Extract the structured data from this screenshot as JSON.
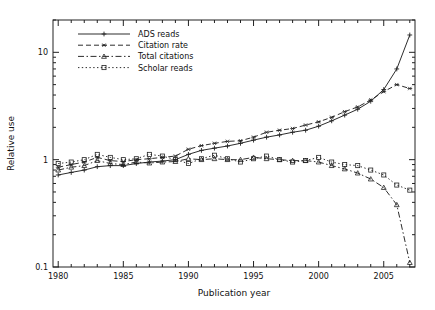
{
  "chart_data": {
    "type": "line",
    "title": "",
    "xlabel": "Publication year",
    "ylabel": "Relative use",
    "xlim": [
      1979.6,
      2007.4
    ],
    "ylim": [
      0.1,
      20
    ],
    "yscale": "log",
    "grid": false,
    "legend_position": "top-left-inside",
    "xticks": [
      1980,
      1985,
      1990,
      1995,
      2000,
      2005
    ],
    "xtick_labels": [
      "1980",
      "1985",
      "1990",
      "1995",
      "2000",
      "2005"
    ],
    "yticks": [
      0.1,
      1,
      10
    ],
    "ytick_labels": [
      "0.1",
      "1",
      "10"
    ],
    "x": [
      1980,
      1981,
      1982,
      1983,
      1984,
      1985,
      1986,
      1987,
      1988,
      1989,
      1990,
      1991,
      1992,
      1993,
      1994,
      1995,
      1996,
      1997,
      1998,
      1999,
      2000,
      2001,
      2002,
      2003,
      2004,
      2005,
      2006,
      2007
    ],
    "series": [
      {
        "name": "ADS reads",
        "marker": "plus",
        "linestyle": "solid",
        "values": [
          0.72,
          0.76,
          0.8,
          0.86,
          0.88,
          0.88,
          0.92,
          0.95,
          0.97,
          1.0,
          1.12,
          1.22,
          1.28,
          1.34,
          1.42,
          1.52,
          1.62,
          1.7,
          1.8,
          1.88,
          2.05,
          2.3,
          2.6,
          2.95,
          3.5,
          4.5,
          7.0,
          14.5
        ]
      },
      {
        "name": "Citation rate",
        "marker": "asterisk",
        "linestyle": "dashed",
        "values": [
          0.85,
          0.9,
          0.95,
          1.05,
          0.98,
          0.96,
          1.0,
          1.02,
          1.05,
          1.08,
          1.25,
          1.35,
          1.42,
          1.48,
          1.5,
          1.62,
          1.8,
          1.88,
          1.95,
          2.1,
          2.25,
          2.48,
          2.8,
          3.1,
          3.6,
          4.3,
          5.0,
          4.6
        ]
      },
      {
        "name": "Total citations",
        "marker": "triangle",
        "linestyle": "dashdot",
        "values": [
          0.8,
          0.85,
          0.88,
          0.98,
          0.92,
          0.9,
          0.95,
          0.93,
          0.95,
          0.96,
          1.02,
          1.0,
          1.02,
          1.0,
          1.0,
          1.05,
          1.02,
          1.0,
          0.98,
          0.98,
          0.95,
          0.88,
          0.82,
          0.75,
          0.66,
          0.55,
          0.38,
          0.11
        ]
      },
      {
        "name": "Scholar reads",
        "marker": "square",
        "linestyle": "dotted",
        "values": [
          0.92,
          0.95,
          1.0,
          1.12,
          1.05,
          1.0,
          1.02,
          1.12,
          1.08,
          1.0,
          0.92,
          1.02,
          1.1,
          1.02,
          0.95,
          1.02,
          1.08,
          1.0,
          0.95,
          0.98,
          1.05,
          0.95,
          0.9,
          0.88,
          0.8,
          0.72,
          0.58,
          0.52
        ]
      }
    ]
  }
}
